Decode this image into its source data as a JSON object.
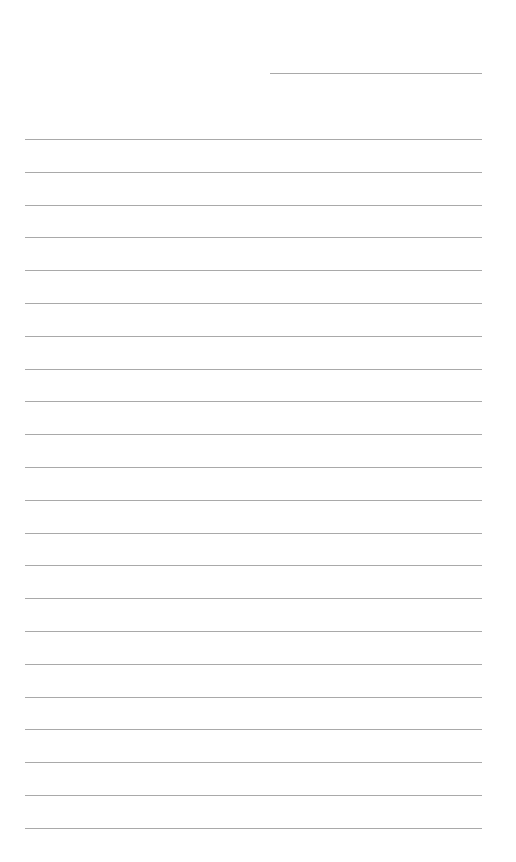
{
  "document": {
    "type": "lined-paper",
    "header_line": {
      "x": 270,
      "y": 73,
      "width": 212
    },
    "ruled_lines": {
      "count": 22,
      "start_y": 139,
      "spacing": 32.8,
      "x": 25,
      "width": 457,
      "color": "#9a9a9a"
    }
  }
}
